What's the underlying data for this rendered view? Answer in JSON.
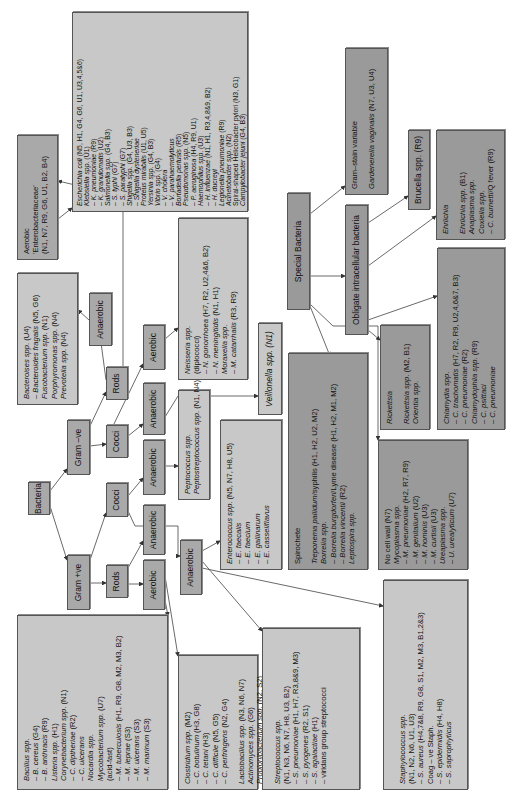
{
  "nodes": {
    "bacteria": "Bacteria",
    "gram_pos": "Gram +ve",
    "gram_neg": "Gram –ve",
    "rods_pos": "Rods",
    "cocci_pos": "Cocci",
    "rods_neg": "Rods",
    "cocci_neg": "Cocci",
    "aerobic_pos_rods": "Aerobic",
    "anaerobic_pos_rods": "Anaerobic",
    "anaerobic_pos_cocci": "Anaerobic",
    "aerobic_pos_cocci": "Anaerobic",
    "anaerobic_neg_cocci": "Anaerobic",
    "aerobic_neg_cocci": "Aerobic",
    "anaerobic_neg_rods": "Anaerobic",
    "special_bacteria": "Special Bacteria",
    "obligate_intracellular": "Obligate intracellular bacteria"
  },
  "boxes": {
    "enterobacteriaceae_header": {
      "lines": [
        "Aerobic",
        "'Enterobacteriaceae'",
        "(N1, N7, R9, G6, U1, B2, B4)"
      ]
    },
    "enterobacteriaceae_list": {
      "lines": [
        "Escherichia coli (N5, H1, G4, G6, U1, U3,4,5&6)",
        "Klebsiella spp. (U1)",
        "– K. pneumoniae (R9)",
        "– K. granulomatis (U2)",
        "Salmonella spp. (G4, B3)",
        "– S. typhi (G7)",
        "– S. paratyphi (G7)",
        "Shigella spp. (G4, U3, B3)",
        "– Shigella dysteneriae",
        "Proteus mirabilis (U1, U5)",
        "Yersinia spp. (G4, B3)",
        "Vibrio spp. (G4)",
        "– V. cholera",
        "– V. parahaemolyticus",
        "Bortadella pertusis (R5)",
        "Pseudomonas spp. (N5)",
        "– P. aeruginosa (H4, R9, U1)",
        "Haemophilus spp. (U3)",
        "– H. influenzae (N1, H1, R3,4,8&9, B2)",
        "– H. ducreyi",
        "Legionella pneumoniae (R9)",
        "Acinetobacter spp. (N2)",
        "Spiral-shaped Helicobacter pylori (N3, G1)",
        "Campylobacter jejuni (G4, B3)"
      ]
    },
    "bacteroides": {
      "lines": [
        "Bacteroises spp. (U4)",
        "– Bacteroides fragalis (N5, G6)",
        "Fusobacterium spp. (N1)",
        "Porphyromonas spp. (N4)",
        "Prevotella spp. (N4)"
      ]
    },
    "neisseria": {
      "lines": [
        "Neisseria spp.",
        "(diplococci)",
        "– N. gonorrhoea (H7, R2, U2,4&6, B2)",
        "– N. meningitidis (N1, H1)",
        "Moraxella spp.",
        "– M. catarrhalis (R3, R9)"
      ]
    },
    "peptococcus": {
      "lines": [
        "Peptococcus spp.",
        "Peptostreptococcus spp. (N1, N4)"
      ]
    },
    "veillonella": {
      "lines": [
        "Veillonella spp. (N1)"
      ]
    },
    "enterococcus": {
      "lines": [
        "Enterococcus spp. (N5, N7, H8, U5)",
        "– E. faecalis",
        "– E. faecium",
        "– E. gallinarum",
        "– E. casseliflavus"
      ]
    },
    "spirochete": {
      "title": "Spirochete",
      "lines": [
        "Treponema pallidum/syphilis (H1, H2, U2, M2)",
        "Borrelia spp.",
        "– Borrelia burgdorferi/Lyme disease (H1, H2, M1, M2)",
        "– Borrelia vincentii (R2)",
        "Leptospira spp."
      ]
    },
    "no_cell_wall": {
      "lines": [
        "No cell wall (N7)",
        "Mycoplasma spp.",
        "– M. pneumoniae (H2, R7, R9)",
        "– M. genitalium (U2)",
        "– M. hominis (U3)",
        "– M. curtisii (U3)",
        "Ureaplasma spp.",
        "– U. urealyticum (U7)"
      ]
    },
    "gram_stain_variable": {
      "title": "Gram–stain variable",
      "lines": [
        "Gardenerella vaginalis (N7, U3, U4)"
      ]
    },
    "brucella": {
      "lines": [
        "Brucella spp. (R9)"
      ]
    },
    "ehrlichia": {
      "title": "Ehrlichia",
      "lines": [
        "Ehrlichia spp. (B1)",
        "Anaplasma spp.",
        "Coxiella spp.",
        "– C. burnetti/Q fever (R9)"
      ]
    },
    "chlamydia": {
      "lines": [
        "Chlamydia spp.",
        "– C. trachomatis (H7, R2, R9, U2,4,6&7, B3)",
        "– C. pneumoniae (R2)",
        "Chlamydophila spp. (R9)",
        "– C. psittaci",
        "– C. pneumoniae"
      ]
    },
    "rickettsia": {
      "title": "Rickettsia",
      "lines": [
        "Rickettsia spp. (M2, B1)",
        "Orientia spp."
      ]
    },
    "bacillus": {
      "lines": [
        "Bacillus spp.",
        "– B. cereus (G4)",
        "– B. anthracis (R9)",
        "Listeria spp. (H1)",
        "Corynebacterium spp. (N1)",
        "– C. diptheriae (R2)",
        "– C. ulcerans",
        "Nocardia spp.",
        "Mycobacterium spp. (U7)",
        "(acid-fast)",
        "– M. tuberculosis (H1, R9, G8, M2, M3, B2)",
        "– M. leprae (S3)",
        "– M. ulcerans (S3)",
        "– M. marinum (S3)"
      ]
    },
    "clostridium": {
      "lines": [
        "Clostridium spp. (M2)",
        "– C. botulinum (H3, G8)",
        "– C. tetani (H3)",
        "– C. difficile (N5, G5)",
        "– C. perfringens (N2, G4)"
      ],
      "lines2": [
        "Lactobacillus spp. (N3, N6, N7)",
        "Actinomyces spp. (G6)",
        "Propionibacterium spp. (N2, S2)",
        "Bifidobacterium (N5)",
        "Eubacterium (N5)"
      ]
    },
    "streptococcus": {
      "lines": [
        "Streptococcus spp.",
        "(N1, N3, N6, N7, H8, U3, B2)",
        "– S. pneumoniae (H1, H7, R3,8&9, M3)",
        "– S. pyogenes (R2, S1)",
        "– S. agalactiae (H1)",
        "– viridans group streptococci"
      ]
    },
    "staphylococcus": {
      "lines": [
        "Staphylococcus spp.",
        "(N1, N2, N6, U1, U3)",
        "– S. aureus (H4,7&8, R9, G8, S1, M2, M3, B1,2&3)",
        "Coag – ve Staph.",
        "– S. epidermidis (H4, H8)",
        "– S. saprophyticus"
      ]
    }
  }
}
